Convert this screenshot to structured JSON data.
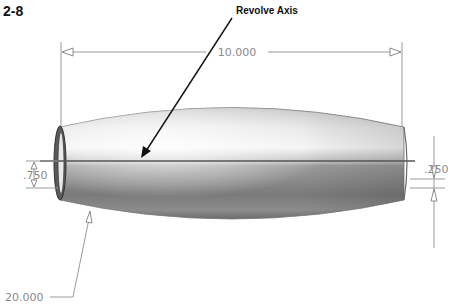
{
  "figure": {
    "label": "2-8",
    "callout": "Revolve Axis"
  },
  "dimensions": {
    "overall_length": "10.000",
    "left_radius": ".750",
    "wall_thickness": ".250",
    "arc_radius": "20.000"
  },
  "colors": {
    "dimension": "#9a9a9a",
    "axis": "#555555",
    "body_light": "#f4f4f4",
    "body_dark": "#6f6f6f"
  }
}
